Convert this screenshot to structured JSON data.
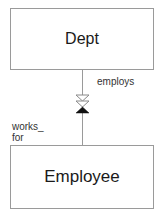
{
  "diagram": {
    "type": "entity-relationship",
    "entities": [
      {
        "id": "dept",
        "label": "Dept"
      },
      {
        "id": "employee",
        "label": "Employee"
      }
    ],
    "relationship": {
      "from": "dept",
      "to": "employee",
      "forward_role": "employs",
      "reverse_role_line1": "works_",
      "reverse_role_line2": "for",
      "forward_marker": "double-hollow-triangle",
      "reverse_marker": "filled-triangle"
    },
    "colors": {
      "border": "#9a9a9a",
      "line": "#9a9a9a",
      "marker_fill": "#111111",
      "text": "#1a1a1a"
    }
  }
}
